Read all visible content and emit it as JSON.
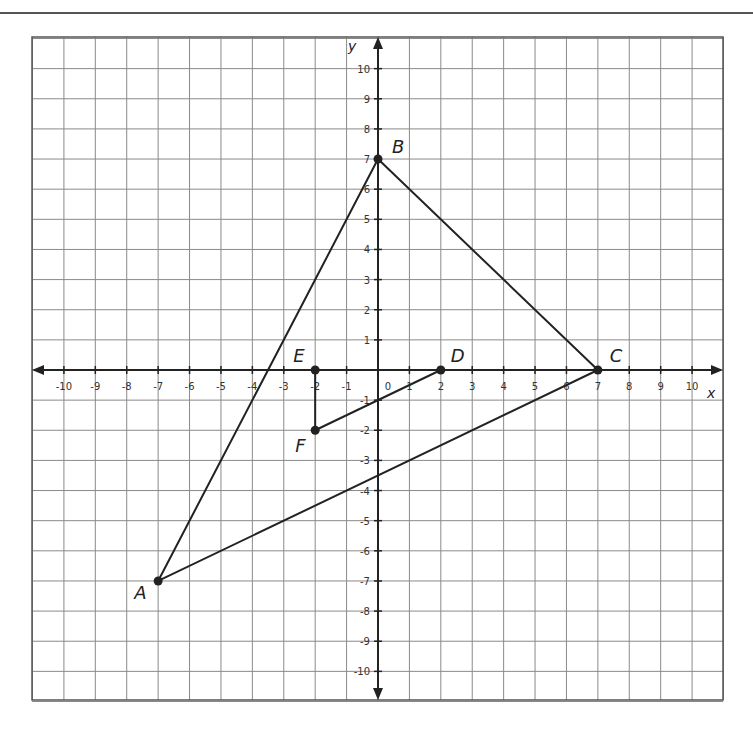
{
  "diagram": {
    "type": "coordinate-plane",
    "x_axis_label": "x",
    "y_axis_label": "y",
    "x_range": [
      -11,
      11
    ],
    "y_range": [
      -11,
      11
    ],
    "x_ticks": [
      -10,
      -9,
      -8,
      -7,
      -6,
      -5,
      -4,
      -3,
      -2,
      -1,
      0,
      1,
      2,
      3,
      4,
      5,
      6,
      7,
      8,
      9,
      10
    ],
    "y_ticks": [
      10,
      9,
      8,
      7,
      6,
      5,
      4,
      3,
      2,
      1,
      -1,
      -2,
      -3,
      -4,
      -5,
      -6,
      -7,
      -8,
      -9,
      -10
    ],
    "points": [
      {
        "label": "A",
        "x": -7,
        "y": -7
      },
      {
        "label": "B",
        "x": 0,
        "y": 7
      },
      {
        "label": "C",
        "x": 7,
        "y": 0
      },
      {
        "label": "D",
        "x": 2,
        "y": 0
      },
      {
        "label": "E",
        "x": -2,
        "y": 0
      },
      {
        "label": "F",
        "x": -2,
        "y": -2
      }
    ],
    "polygons": [
      {
        "name": "triangle-ABC",
        "vertices": [
          "A",
          "B",
          "C"
        ]
      },
      {
        "name": "triangle-DEF",
        "vertices": [
          "D",
          "E",
          "F"
        ]
      }
    ],
    "colors": {
      "grid": "#8a8a8a",
      "axis": "#222222",
      "shape": "#222222",
      "border": "#555555"
    }
  }
}
